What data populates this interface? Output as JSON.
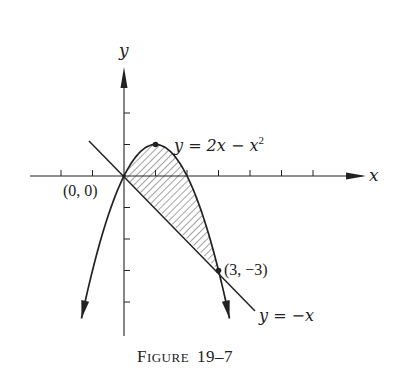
{
  "figure": {
    "caption_big": "F",
    "caption_small": "IGURE",
    "caption_num": "19–7",
    "axis_x_label": "x",
    "axis_y_label": "y",
    "origin_label": "(0, 0)",
    "intersection_label": "(3, −3)",
    "curve_label_prefix": "y = 2x − x",
    "curve_label_exp": "2",
    "line_label": "y = −x",
    "colors": {
      "ink": "#222222",
      "background": "#ffffff",
      "hatch": "#333333"
    }
  },
  "chart_data": {
    "type": "line",
    "xlabel": "x",
    "ylabel": "y",
    "xlim": [
      -3,
      8
    ],
    "ylim": [
      -5,
      4
    ],
    "grid": false,
    "x_ticks": [
      -2,
      -1,
      1,
      2,
      3,
      4,
      5,
      6
    ],
    "y_ticks": [
      -4,
      -3,
      -2,
      -1,
      1,
      2
    ],
    "series": [
      {
        "name": "y = 2x − x^2",
        "kind": "parabola",
        "x_range": [
          -1.35,
          3.35
        ],
        "vertex": [
          1,
          1
        ]
      },
      {
        "name": "y = −x",
        "kind": "line",
        "x_range": [
          -1.1,
          4.2
        ]
      }
    ],
    "points": [
      {
        "label": "(0, 0)",
        "x": 0,
        "y": 0
      },
      {
        "label": "(3, −3)",
        "x": 3,
        "y": -3
      },
      {
        "label": "vertex",
        "x": 1,
        "y": 1
      }
    ],
    "shaded_region": "between y = 2x − x^2 (above) and y = −x (below), 0 ≤ x ≤ 3"
  }
}
